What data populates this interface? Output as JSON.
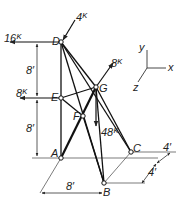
{
  "figure": {
    "type": "space truss diagram",
    "nodes": {
      "D": "D",
      "E": "E",
      "A": "A",
      "G": "G",
      "F": "F",
      "B": "B",
      "C": "C"
    },
    "loads": {
      "D_horizontal": "16ᴷ",
      "D_inclined": "4ᴷ",
      "E_horizontal": "8ᴷ",
      "G_inclined": "8ᴷ",
      "G_vertical": "48ᴷ"
    },
    "dimensions": {
      "DE": "8′",
      "EA": "8′",
      "AB_horizontal": "8′",
      "BC_lower": "4′",
      "BC_upper": "4′"
    },
    "axes": {
      "x": "x",
      "y": "y",
      "z": "z"
    }
  }
}
